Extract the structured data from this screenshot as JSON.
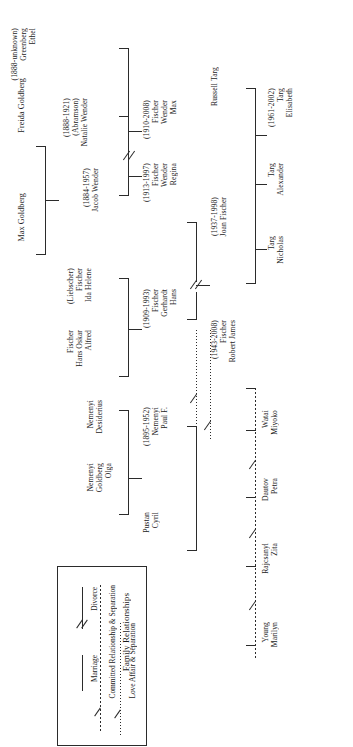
{
  "diagram": {
    "kind": "family-tree",
    "orientation": "rotated-90-counterclockwise"
  },
  "people": {
    "max_goldberg": {
      "lines": [
        "Max Goldberg"
      ]
    },
    "freida_goldberg": {
      "lines": [
        "Freida Goldberg"
      ]
    },
    "ethel_greenberg": {
      "lines": [
        "Ethel",
        "Greenberg",
        "(1888-unknown)"
      ]
    },
    "natalie_wender": {
      "lines": [
        "Natalie Wender",
        "(Abramson)",
        "(1888-1921)"
      ]
    },
    "jacob_wender": {
      "lines": [
        "Jacob Wender",
        "(1884-1957)"
      ]
    },
    "ida_helene_fischer": {
      "lines": [
        "Ida Helene",
        "Fischer",
        "(Liebscher)"
      ]
    },
    "alfred_fischer": {
      "lines": [
        "Alfred",
        "Hans Oskar",
        "Fischer"
      ]
    },
    "max_wender_fischer": {
      "lines": [
        "Max",
        "Wender",
        "Fischer",
        "(1910-2008)"
      ]
    },
    "regina_fischer": {
      "lines": [
        "Regina",
        "Wender",
        "Fischer",
        "(1913-1997)"
      ]
    },
    "hans_gerhardt": {
      "lines": [
        "Hans",
        "Gerhardt",
        "Fischer",
        "(1909-1993)"
      ]
    },
    "desiderius_nemenyi": {
      "lines": [
        "Desiderius",
        "Nemenyi"
      ]
    },
    "olga_goldberg": {
      "lines": [
        "Olga",
        "Goldberg",
        "Nemenyi"
      ]
    },
    "paul_nemenyi": {
      "lines": [
        "Paul F.",
        "Nemenyi",
        "(1895-1952)"
      ]
    },
    "cyril_pustan": {
      "lines": [
        "Cyril",
        "Pustan"
      ]
    },
    "joan_fischer": {
      "lines": [
        "Joan Fischer",
        "(1937-1998)"
      ]
    },
    "russell_targ": {
      "lines": [
        "Russell Targ"
      ]
    },
    "nicholas_targ": {
      "lines": [
        "Nicholas",
        "Targ"
      ]
    },
    "alexander_targ": {
      "lines": [
        "Alexander",
        "Targ"
      ]
    },
    "elisabeth_targ": {
      "lines": [
        "Elisabeth",
        "Targ",
        "(1961-2002)"
      ]
    },
    "robert_james_fischer": {
      "lines": [
        "Robert James",
        "Fischer",
        "(1943-2008)"
      ]
    },
    "miyoko_watai": {
      "lines": [
        "Miyoko",
        "Watai"
      ]
    },
    "petra_dautov": {
      "lines": [
        "Petra",
        "Dautov"
      ]
    },
    "zita_rajcsanyl": {
      "lines": [
        "Zita",
        "Rajcsanyl"
      ]
    },
    "marilyn_young": {
      "lines": [
        "Marilyn",
        "Young"
      ]
    }
  },
  "legend": {
    "title": "Family Relationships",
    "entries": [
      {
        "key": "marriage",
        "label": "Marriage",
        "style": "solid"
      },
      {
        "key": "divorce",
        "label": "Divorce",
        "style": "solid-slash"
      },
      {
        "key": "committed",
        "label": "Committed Relationship & Separation",
        "style": "dashed-slash"
      },
      {
        "key": "affair",
        "label": "Love Affair & Separation",
        "style": "dotted-slash"
      }
    ]
  },
  "colors": {
    "ink": "#1a1a1a",
    "line": "#2b2b2b",
    "background": "#ffffff"
  }
}
